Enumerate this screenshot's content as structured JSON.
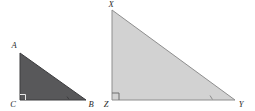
{
  "figure": {
    "background_color": "#ffffff",
    "triangles": [
      {
        "id": "small-triangle",
        "name": "triangle-abc",
        "fill_color": "#58585a",
        "stroke_color": "#3c3c3e",
        "stroke_width": 1,
        "points": "20,53 20,100 86,100",
        "right_angle_vertex": "C",
        "right_angle_mark": {
          "path": "M 20,94.5 L 25.5,94.5 L 25.5,100",
          "stroke_color": "#e8e8e8"
        },
        "tick_mark": {
          "path": "M 67,96.6 L 69,99.4",
          "stroke_color": "#3c3c3e"
        },
        "vertices": [
          {
            "label": "A",
            "x": 14,
            "y": 48,
            "anchor": "middle"
          },
          {
            "label": "C",
            "x": 13,
            "y": 107,
            "anchor": "middle"
          },
          {
            "label": "B",
            "x": 91,
            "y": 107,
            "anchor": "middle"
          }
        ]
      },
      {
        "id": "large-triangle",
        "name": "triangle-xyz",
        "fill_color": "#d2d2d2",
        "stroke_color": "#8e8e8e",
        "stroke_width": 1,
        "points": "112,10 112,100 235,100",
        "right_angle_vertex": "Z",
        "right_angle_mark": {
          "path": "M 112,93 L 119,93 L 119,100",
          "stroke_color": "#6e6e6e"
        },
        "tick_mark": {
          "path": "M 210,95.5 L 212.5,99.5",
          "stroke_color": "#8e8e8e"
        },
        "vertices": [
          {
            "label": "X",
            "x": 111,
            "y": 7,
            "anchor": "middle"
          },
          {
            "label": "Z",
            "x": 106,
            "y": 107,
            "anchor": "middle"
          },
          {
            "label": "Y",
            "x": 241,
            "y": 107,
            "anchor": "middle"
          }
        ]
      }
    ]
  }
}
